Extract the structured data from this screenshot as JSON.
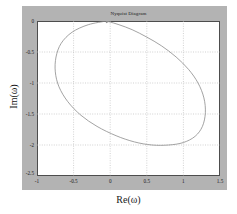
{
  "figure": {
    "title": "Nyquist Diagram",
    "panel_color": "#b3b3b3",
    "axes_bg": "#ffffff",
    "axis_color": "#4d4d4d",
    "curve_color": "#999999",
    "grid_color": "#b3b3b3"
  },
  "chart_data": {
    "type": "line",
    "title": "Nyquist Diagram",
    "xlabel": "Re(ω)",
    "ylabel": "Im(ω)",
    "xlim": [
      -1,
      1.5
    ],
    "ylim": [
      -2.5,
      0
    ],
    "xticks": [
      "-1",
      "-0.5",
      "0",
      "0.5",
      "1",
      "1.5"
    ],
    "xtick_values": [
      -1,
      -0.5,
      0,
      0.5,
      1,
      1.5
    ],
    "yticks": [
      "0",
      "-0.5",
      "-1",
      "-1.5",
      "-2",
      "-2.5"
    ],
    "ytick_values": [
      0,
      -0.5,
      -1,
      -1.5,
      -2,
      -2.5
    ],
    "grid": true,
    "grid_style": "dotted",
    "legend": null,
    "annotations": [
      {
        "name": "direction-arrow",
        "x": -0.05,
        "y": 0.0,
        "shape": "arrowhead"
      }
    ],
    "series": [
      {
        "name": "Nyquist contour",
        "closed": true,
        "description": "Closed oval contour spanning Re from -0.75 to 1.30 and Im from 0 down to -2.0, centered near (0.27, -1.0)",
        "x": [
          -0.05,
          -0.3,
          -0.52,
          -0.67,
          -0.74,
          -0.75,
          -0.7,
          -0.58,
          -0.4,
          -0.18,
          0.08,
          0.33,
          0.57,
          0.8,
          1.0,
          1.16,
          1.26,
          1.3,
          1.28,
          1.2,
          1.07,
          0.9,
          0.7,
          0.5,
          0.3,
          0.12,
          -0.02,
          -0.05
        ],
        "y": [
          0.0,
          -0.06,
          -0.18,
          -0.36,
          -0.58,
          -0.82,
          -1.06,
          -1.3,
          -1.52,
          -1.7,
          -1.85,
          -1.95,
          -2.0,
          -2.0,
          -1.96,
          -1.86,
          -1.7,
          -1.48,
          -1.24,
          -1.0,
          -0.78,
          -0.58,
          -0.4,
          -0.26,
          -0.14,
          -0.06,
          -0.01,
          0.0
        ]
      }
    ]
  }
}
